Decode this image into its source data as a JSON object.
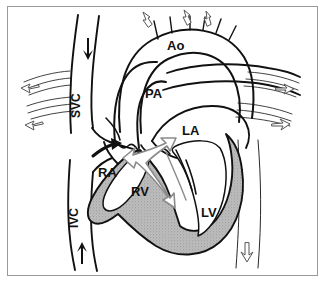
{
  "figure": {
    "frame_color": "#9a9a9a",
    "background_color": "#ffffff",
    "line_color": "#111111",
    "myocardium_fill": "#b0b0b0",
    "jet_arrow_color": "#8a8a8a"
  },
  "labels": {
    "aorta": "Ao",
    "pulmonary_artery": "PA",
    "left_atrium": "LA",
    "right_atrium": "RA",
    "right_ventricle": "RV",
    "left_ventricle": "LV",
    "superior_vena_cava": "SVC",
    "inferior_vena_cava": "IVC"
  },
  "flow_arrows": {
    "svc_inflow": "solid-down-arrow",
    "ivc_inflow": "solid-up-arrow",
    "tricuspid_inflow": "solid-curved-arrow",
    "aortic_arch_branch_1": "outline-up-arrow",
    "aortic_arch_branch_2": "outline-up-arrow",
    "aortic_arch_branch_3": "outline-up-arrow",
    "left_pulmonary_upper": "outline-left-arrow",
    "left_pulmonary_lower": "outline-left-arrow",
    "right_pulmonary_upper": "outline-right-arrow",
    "right_pulmonary_lower": "outline-right-arrow",
    "descending_aorta": "outline-down-arrow",
    "septal_jet": "double-headed-outline-arrow"
  }
}
